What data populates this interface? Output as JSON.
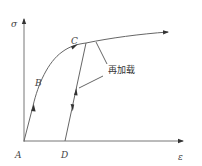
{
  "diagram": {
    "title": "",
    "axes": {
      "y_label": "σ",
      "x_label": "ε"
    },
    "points": {
      "A": "A",
      "B": "B",
      "C": "C",
      "D": "D"
    },
    "annotation": "再加载",
    "colors": {
      "line": "#666666",
      "axis": "#777777",
      "text": "#444444",
      "background": "#ffffff"
    }
  }
}
